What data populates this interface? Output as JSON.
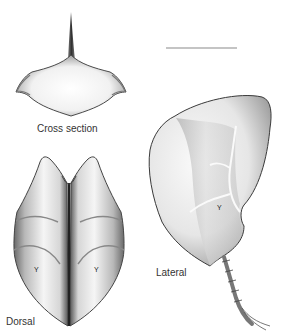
{
  "figure": {
    "views": [
      {
        "id": "cross",
        "label": "Cross section"
      },
      {
        "id": "dorsal",
        "label": "Dorsal"
      },
      {
        "id": "lateral",
        "label": "Lateral"
      }
    ],
    "scale_bar": {
      "label": ""
    },
    "colors": {
      "background": "#ffffff",
      "outline": "#3a3a3a",
      "shade_dark": "#6a6a6a",
      "shade_mid": "#a8a8a8",
      "shade_light": "#eeeeee",
      "scale_bar": "#8a8a8a"
    }
  }
}
